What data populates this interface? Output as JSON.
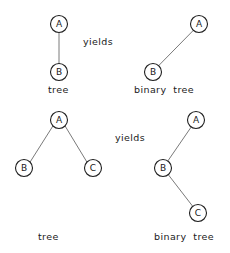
{
  "figure": {
    "width": 230,
    "height": 253,
    "background_color": "#ffffff",
    "node_stroke_color": "#1f1f1f",
    "node_fill_color": "#ffffff",
    "edge_color": "#7a7a7a",
    "text_color": "#1a1a1a"
  },
  "diagrams": [
    {
      "id": "top-left-tree",
      "caption": "tree",
      "caption_x": 48,
      "caption_y": 84,
      "nodes": [
        {
          "label": "A",
          "cx": 59,
          "cy": 24,
          "r": 8.5
        },
        {
          "label": "B",
          "cx": 59,
          "cy": 72,
          "r": 8.5
        }
      ],
      "edges": [
        {
          "from": "A",
          "to": "B"
        }
      ]
    },
    {
      "id": "top-right-binary-tree",
      "caption": "binary tree",
      "caption_x": 134,
      "caption_y": 84,
      "nodes": [
        {
          "label": "A",
          "cx": 199,
          "cy": 24,
          "r": 8.5
        },
        {
          "label": "B",
          "cx": 153,
          "cy": 72,
          "r": 8.5
        }
      ],
      "edges": [
        {
          "from": "A",
          "to": "B"
        }
      ]
    },
    {
      "id": "bottom-left-tree",
      "caption": "tree",
      "caption_x": 38,
      "caption_y": 231,
      "nodes": [
        {
          "label": "A",
          "cx": 59,
          "cy": 120,
          "r": 8.5
        },
        {
          "label": "B",
          "cx": 24,
          "cy": 168,
          "r": 8.5
        },
        {
          "label": "C",
          "cx": 93,
          "cy": 168,
          "r": 8.5
        }
      ],
      "edges": [
        {
          "from": "A",
          "to": "B"
        },
        {
          "from": "A",
          "to": "C"
        }
      ]
    },
    {
      "id": "bottom-right-binary-tree",
      "caption": "binary tree",
      "caption_x": 154,
      "caption_y": 231,
      "nodes": [
        {
          "label": "A",
          "cx": 196,
          "cy": 120,
          "r": 8.5
        },
        {
          "label": "B",
          "cx": 163,
          "cy": 168,
          "r": 8.5
        },
        {
          "label": "C",
          "cx": 198,
          "cy": 213,
          "r": 8.5
        }
      ],
      "edges": [
        {
          "from": "A",
          "to": "B"
        },
        {
          "from": "B",
          "to": "C"
        }
      ]
    }
  ],
  "yields": [
    {
      "id": "yields-top",
      "text": "yields",
      "x": 83,
      "y": 36
    },
    {
      "id": "yields-bottom",
      "text": "yields",
      "x": 115,
      "y": 132
    }
  ],
  "node_labels": {
    "a": "A",
    "b": "B",
    "c": "C"
  },
  "captions": {
    "tree": "tree",
    "binary_tree": "binary  tree"
  }
}
